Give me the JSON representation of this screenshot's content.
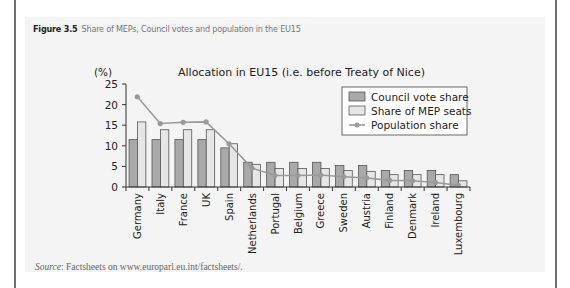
{
  "figure": {
    "number": "Figure 3.5",
    "caption": "Share of MEPs, Council votes and population in the EU15",
    "source_label": "Source",
    "source_text": ": Factsheets on www.europarl.eu.int/factsheets/."
  },
  "colors": {
    "council": "#a9a9a9",
    "mep": "#e6e6e6",
    "population": "#9a9a9a",
    "axis": "#333333"
  },
  "chart_data": {
    "type": "bar",
    "title": "Allocation in EU15 (i.e. before Treaty of Nice)",
    "ylabel": "(%)",
    "xlabel": "",
    "ylim": [
      0,
      25
    ],
    "yticks": [
      0,
      5,
      10,
      15,
      20,
      25
    ],
    "grid": false,
    "legend_position": "upper right",
    "categories": [
      "Germany",
      "Italy",
      "France",
      "UK",
      "Spain",
      "Netherlands",
      "Portugal",
      "Belgium",
      "Greece",
      "Sweden",
      "Austria",
      "Finland",
      "Denmark",
      "Ireland",
      "Luxembourg"
    ],
    "series": [
      {
        "name": "Council vote share",
        "type": "bar",
        "values": [
          11.5,
          11.5,
          11.5,
          11.5,
          9.5,
          6.0,
          6.0,
          6.0,
          6.0,
          5.2,
          5.2,
          4.0,
          4.0,
          4.0,
          3.0
        ]
      },
      {
        "name": "Share of MEP seats",
        "type": "bar",
        "values": [
          15.8,
          13.9,
          13.9,
          13.9,
          10.5,
          5.5,
          4.5,
          4.5,
          4.5,
          4.0,
          3.8,
          3.0,
          3.0,
          3.0,
          1.5
        ]
      },
      {
        "name": "Population share",
        "type": "line",
        "values": [
          21.9,
          15.4,
          15.7,
          15.8,
          10.5,
          4.6,
          2.8,
          2.8,
          2.9,
          2.5,
          2.2,
          1.6,
          1.5,
          1.1,
          0.4
        ]
      }
    ]
  }
}
